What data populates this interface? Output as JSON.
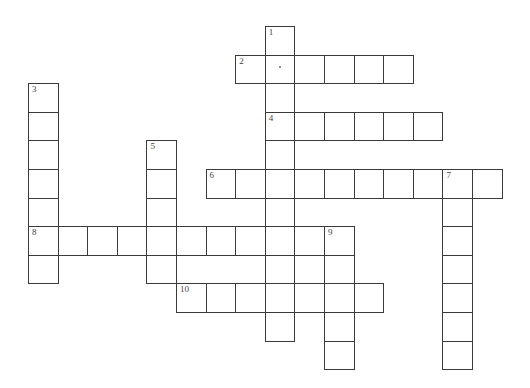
{
  "puzzle": {
    "type": "crossword",
    "cell_width": 29.6,
    "cell_height": 28.6,
    "origin_x": 28,
    "origin_y": 26,
    "words": [
      {
        "number": "1",
        "direction": "down",
        "col": 8,
        "row": 0,
        "length": 11
      },
      {
        "number": "2",
        "direction": "across",
        "col": 7,
        "row": 1,
        "length": 6
      },
      {
        "number": "3",
        "direction": "down",
        "col": 0,
        "row": 2,
        "length": 7
      },
      {
        "number": "4",
        "direction": "across",
        "col": 8,
        "row": 3,
        "length": 6
      },
      {
        "number": "5",
        "direction": "down",
        "col": 4,
        "row": 4,
        "length": 5
      },
      {
        "number": "6",
        "direction": "across",
        "col": 6,
        "row": 5,
        "length": 10
      },
      {
        "number": "7",
        "direction": "down",
        "col": 14,
        "row": 5,
        "length": 7
      },
      {
        "number": "8",
        "direction": "across",
        "col": 0,
        "row": 7,
        "length": 11
      },
      {
        "number": "9",
        "direction": "down",
        "col": 10,
        "row": 7,
        "length": 5
      },
      {
        "number": "10",
        "direction": "across",
        "col": 5,
        "row": 9,
        "length": 7
      }
    ]
  }
}
